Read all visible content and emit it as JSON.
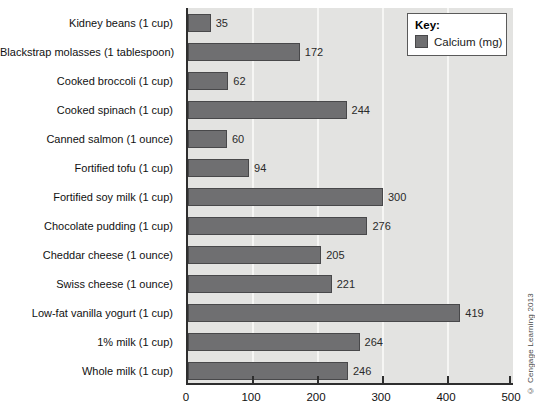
{
  "figure": {
    "credit": "© Cengage Learning 2013"
  },
  "key": {
    "title": "Key:",
    "items": [
      {
        "label": "Calcium (mg)"
      }
    ]
  },
  "chart_data": {
    "type": "bar",
    "orientation": "horizontal",
    "title": "",
    "xlabel": "",
    "ylabel": "",
    "series_name": "Calcium (mg)",
    "categories": [
      "Kidney beans (1 cup)",
      "Blackstrap molasses (1 tablespoon)",
      "Cooked broccoli (1 cup)",
      "Cooked spinach (1 cup)",
      "Canned salmon (1 ounce)",
      "Fortified tofu (1 cup)",
      "Fortified soy milk (1 cup)",
      "Chocolate pudding (1 cup)",
      "Cheddar cheese (1 ounce)",
      "Swiss cheese (1 ounce)",
      "Low-fat vanilla yogurt (1 cup)",
      "1% milk (1 cup)",
      "Whole milk (1 cup)"
    ],
    "values": [
      35,
      172,
      62,
      244,
      60,
      94,
      300,
      276,
      205,
      221,
      419,
      264,
      246
    ],
    "xlim": [
      0,
      500
    ],
    "xticks": [
      0,
      100,
      200,
      300,
      400,
      500
    ],
    "grid": true,
    "legend_position": "top-right",
    "colors": {
      "bar_fill": "#6f6f71",
      "bar_border": "#48484a",
      "plot_bg": "#e3e3e1",
      "gridline": "#f6f6f4",
      "axis": "#2e2e2e",
      "tick": "#2e2e2e",
      "text": "#111111"
    }
  }
}
